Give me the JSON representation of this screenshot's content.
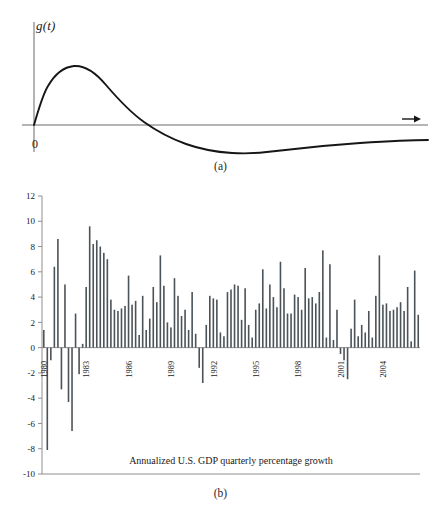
{
  "figure": {
    "panel_a": {
      "caption": "(a)",
      "y_axis_label": "g(t)",
      "origin_label": "0",
      "axis_arrow": "right-arrow-icon",
      "curve_description": "damped impulse response curve rising to a positive peak then crossing zero into a shallow negative trough before decaying toward zero"
    },
    "panel_b": {
      "caption": "(b)",
      "chart_title": "Annualized U.S. GDP quarterly percentage growth"
    }
  },
  "chart_data": {
    "type": "bar",
    "title": "Annualized U.S. GDP quarterly percentage growth",
    "xlabel": "",
    "ylabel": "",
    "ylim": [
      -10,
      12
    ],
    "yticks": [
      -10,
      -8,
      -6,
      -4,
      -2,
      0,
      2,
      4,
      6,
      8,
      10,
      12
    ],
    "ytick_labels": [
      "-10",
      "-8",
      "-6",
      "-4",
      "-2",
      "0",
      "2",
      "4",
      "6",
      "8",
      "10",
      "12"
    ],
    "grid": false,
    "legend": "none",
    "bar_color": "#4c5358",
    "axis_color": "#8f8f8f",
    "x_tick_years": [
      1980,
      1983,
      1986,
      1989,
      1992,
      1995,
      1998,
      2001,
      2004
    ],
    "x_tick_labels": [
      "1980",
      "1983",
      "1986",
      "1989",
      "1992",
      "1995",
      "1998",
      "2001",
      "2004"
    ],
    "x_start_year": 1980,
    "x_start_quarter": 1,
    "periods_per_year": 4,
    "categories": [
      "1980Q1",
      "1980Q2",
      "1980Q3",
      "1980Q4",
      "1981Q1",
      "1981Q2",
      "1981Q3",
      "1981Q4",
      "1982Q1",
      "1982Q2",
      "1982Q3",
      "1982Q4",
      "1983Q1",
      "1983Q2",
      "1983Q3",
      "1983Q4",
      "1984Q1",
      "1984Q2",
      "1984Q3",
      "1984Q4",
      "1985Q1",
      "1985Q2",
      "1985Q3",
      "1985Q4",
      "1986Q1",
      "1986Q2",
      "1986Q3",
      "1986Q4",
      "1987Q1",
      "1987Q2",
      "1987Q3",
      "1987Q4",
      "1988Q1",
      "1988Q2",
      "1988Q3",
      "1988Q4",
      "1989Q1",
      "1989Q2",
      "1989Q3",
      "1989Q4",
      "1990Q1",
      "1990Q2",
      "1990Q3",
      "1990Q4",
      "1991Q1",
      "1991Q2",
      "1991Q3",
      "1991Q4",
      "1992Q1",
      "1992Q2",
      "1992Q3",
      "1992Q4",
      "1993Q1",
      "1993Q2",
      "1993Q3",
      "1993Q4",
      "1994Q1",
      "1994Q2",
      "1994Q3",
      "1994Q4",
      "1995Q1",
      "1995Q2",
      "1995Q3",
      "1995Q4",
      "1996Q1",
      "1996Q2",
      "1996Q3",
      "1996Q4",
      "1997Q1",
      "1997Q2",
      "1997Q3",
      "1997Q4",
      "1998Q1",
      "1998Q2",
      "1998Q3",
      "1998Q4",
      "1999Q1",
      "1999Q2",
      "1999Q3",
      "1999Q4",
      "2000Q1",
      "2000Q2",
      "2000Q3",
      "2000Q4",
      "2001Q1",
      "2001Q2",
      "2001Q3",
      "2001Q4",
      "2002Q1",
      "2002Q2",
      "2002Q3",
      "2002Q4",
      "2003Q1",
      "2003Q2",
      "2003Q3",
      "2003Q4",
      "2004Q1",
      "2004Q2",
      "2004Q3",
      "2004Q4",
      "2005Q1",
      "2005Q2",
      "2005Q3",
      "2005Q4",
      "2006Q1",
      "2006Q2",
      "2006Q3"
    ],
    "values": [
      1.4,
      -8.1,
      -1.0,
      6.4,
      8.6,
      -3.3,
      5.0,
      -4.3,
      -6.6,
      2.7,
      -2.1,
      0.3,
      4.8,
      9.6,
      8.2,
      8.5,
      8.0,
      7.5,
      7.0,
      3.8,
      3.0,
      2.9,
      3.1,
      3.3,
      5.7,
      3.4,
      3.7,
      1.0,
      4.1,
      1.4,
      2.3,
      4.8,
      3.6,
      7.3,
      4.9,
      2.0,
      1.6,
      5.5,
      4.1,
      2.5,
      3.0,
      1.4,
      4.4,
      1.1,
      -1.6,
      -2.8,
      1.8,
      4.1,
      3.9,
      3.8,
      1.2,
      0.9,
      4.4,
      4.6,
      5.0,
      4.9,
      2.2,
      4.7,
      1.8,
      0.8,
      3.0,
      3.5,
      6.2,
      3.1,
      5.0,
      4.0,
      3.2,
      6.8,
      4.7,
      2.7,
      2.7,
      4.2,
      4.0,
      3.0,
      6.3,
      3.9,
      4.0,
      3.5,
      4.4,
      7.7,
      0.8,
      6.6,
      0.6,
      3.0,
      -0.5,
      -1.0,
      -2.5,
      1.5,
      3.8,
      0.9,
      1.8,
      1.2,
      2.9,
      0.8,
      4.1,
      7.3,
      3.4,
      3.5,
      2.9,
      3.0,
      3.2,
      3.6,
      2.9,
      4.8,
      0.5,
      6.1,
      2.6
    ]
  }
}
